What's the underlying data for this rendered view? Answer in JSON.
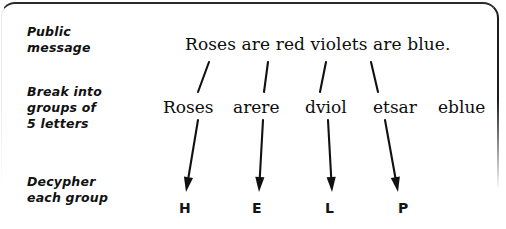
{
  "figure": {
    "background_color": "#ffffff",
    "ink_color": "#111111"
  },
  "steps": [
    {
      "id": "public-message",
      "line1": "Public",
      "line2": "message",
      "line3": ""
    },
    {
      "id": "break-into-groups",
      "line1": "Break into",
      "line2": "groups of",
      "line3": "5 letters"
    },
    {
      "id": "decypher-each-group",
      "line1": "Decypher",
      "line2": "each group",
      "line3": ""
    }
  ],
  "message": {
    "text": "Roses are red violets are blue."
  },
  "groups": [
    {
      "text": "Roses",
      "x": 163
    },
    {
      "text": "arere",
      "x": 233
    },
    {
      "text": "dviol",
      "x": 305
    },
    {
      "text": "etsar",
      "x": 373
    },
    {
      "text": "eblue",
      "x": 438
    }
  ],
  "decyphered": [
    {
      "text": "H",
      "x": 179
    },
    {
      "text": "E",
      "x": 252
    },
    {
      "text": "L",
      "x": 325
    },
    {
      "text": "P",
      "x": 398
    }
  ],
  "connectors": {
    "ticks": [
      {
        "x1": 198,
        "y1": 92,
        "x2": 209,
        "y2": 62
      },
      {
        "x1": 264,
        "y1": 92,
        "x2": 268,
        "y2": 62
      },
      {
        "x1": 320,
        "y1": 92,
        "x2": 326,
        "y2": 62
      },
      {
        "x1": 378,
        "y1": 92,
        "x2": 371,
        "y2": 62
      }
    ],
    "arrows": [
      {
        "x1": 198,
        "y1": 120,
        "x2": 186,
        "y2": 192
      },
      {
        "x1": 263,
        "y1": 120,
        "x2": 259,
        "y2": 192
      },
      {
        "x1": 328,
        "y1": 120,
        "x2": 332,
        "y2": 192
      },
      {
        "x1": 385,
        "y1": 120,
        "x2": 398,
        "y2": 192
      }
    ]
  }
}
